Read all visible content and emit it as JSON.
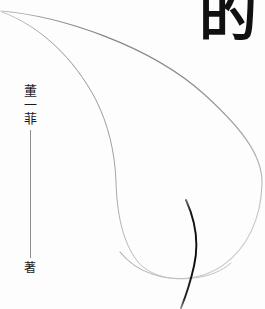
{
  "cover": {
    "type": "book-cover",
    "width": 265,
    "height": 309,
    "background_color": "#fdfdfd",
    "title_partial": "的",
    "title_note": "single large character cropped at top edge",
    "author_name": "董一菲",
    "author_role": "著",
    "colors": {
      "ink_dark": "#111111",
      "ink_text": "#1b1b1b",
      "rule_gray": "#8d8d8d",
      "curve_gray": "#7c8086",
      "curve_light": "#a9adb3",
      "brush_black": "#0d0d0d"
    },
    "artwork": {
      "description": "two thin tapering gray curves forming a large teardrop / leaf sweep from the upper-left corner, plus one dark brush stroke crossing the lower curve",
      "strokes": [
        {
          "name": "outer-curve",
          "color": "#7c8086"
        },
        {
          "name": "inner-curve",
          "color": "#9aa0a6"
        },
        {
          "name": "brush-stroke",
          "color": "#0d0d0d"
        }
      ]
    }
  }
}
